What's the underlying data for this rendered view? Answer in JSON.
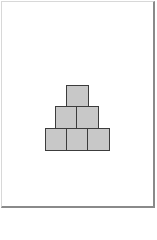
{
  "diagram": {
    "type": "block-pyramid",
    "rows": 3,
    "block_counts_top_to_bottom": [
      1,
      2,
      3
    ],
    "total_blocks": 6,
    "colors": {
      "block_fill": "#c8c8c8",
      "block_stroke": "#3c3c3c",
      "background": "#ffffff",
      "frame_light": "#d8d8d8",
      "frame_dark": "#8a8a8a"
    },
    "blocks": [
      {
        "row": 0,
        "col": 0,
        "x": 66,
        "y": 85
      },
      {
        "row": 1,
        "col": 0,
        "x": 55,
        "y": 106
      },
      {
        "row": 1,
        "col": 1,
        "x": 76,
        "y": 106
      },
      {
        "row": 2,
        "col": 0,
        "x": 45,
        "y": 128
      },
      {
        "row": 2,
        "col": 1,
        "x": 66,
        "y": 128
      },
      {
        "row": 2,
        "col": 2,
        "x": 87,
        "y": 128
      }
    ]
  }
}
